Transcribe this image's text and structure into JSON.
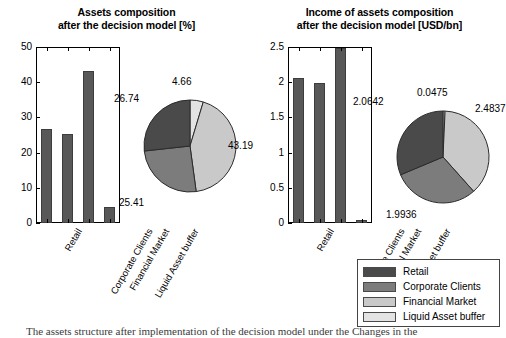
{
  "legend": {
    "items": [
      {
        "label": "Retail",
        "color": "#4a4a4a"
      },
      {
        "label": "Corporate Clients",
        "color": "#7c7c7c"
      },
      {
        "label": "Financial Market",
        "color": "#c9c9c9"
      },
      {
        "label": "Liquid Asset buffer",
        "color": "#e3e3e3"
      }
    ]
  },
  "caption": {
    "text": "The assets structure after implementation of the decision model under the Changes in the"
  },
  "chart_data": [
    {
      "type": "bar",
      "panel": "left",
      "title": "Assets composition",
      "subtitle": "after the decision model [%]",
      "title_line1": "Assets composition",
      "title_line2": "after the decision model [%]",
      "categories": [
        "Retail",
        "Corporate Clients",
        "Financial Market",
        "Liquid Asset buffer"
      ],
      "values": [
        26.74,
        25.41,
        43.19,
        4.66
      ],
      "xlabel": "",
      "ylabel": "",
      "ylim": [
        0,
        50
      ],
      "yticks": [
        0,
        10,
        20,
        30,
        40,
        50
      ],
      "ytick_labels": [
        "0",
        "10",
        "20",
        "30",
        "40",
        "50"
      ],
      "grid": false,
      "bar_color": "#585858"
    },
    {
      "type": "pie",
      "panel": "left",
      "title": "Assets composition",
      "categories": [
        "Liquid Asset buffer",
        "Financial Market",
        "Corporate Clients",
        "Retail"
      ],
      "values": [
        4.66,
        43.19,
        25.41,
        26.74
      ],
      "labels": [
        "4.66",
        "43.19",
        "25.41",
        "26.74"
      ],
      "colors": [
        "#e3e3e3",
        "#c9c9c9",
        "#7c7c7c",
        "#4a4a4a"
      ],
      "legend_position": "bottom-right"
    },
    {
      "type": "bar",
      "panel": "right",
      "title": "Income of assets composition",
      "subtitle": "after the decision model [USD/bn]",
      "title_line1": "Income of assets composition",
      "title_line2": "after the decision model [USD/bn]",
      "categories": [
        "Retail",
        "Corporate Clients",
        "Financial Market",
        "Liquid Asset buffer"
      ],
      "values": [
        2.0642,
        1.9936,
        2.4837,
        0.0475
      ],
      "xlabel": "",
      "ylabel": "",
      "ylim": [
        0,
        2.5
      ],
      "yticks": [
        0,
        0.5,
        1,
        1.5,
        2,
        2.5
      ],
      "ytick_labels": [
        "0",
        "0.5",
        "1",
        "1.5",
        "2",
        "2.5"
      ],
      "grid": false,
      "bar_color": "#585858"
    },
    {
      "type": "pie",
      "panel": "right",
      "title": "Income of assets composition",
      "categories": [
        "Liquid Asset buffer",
        "Financial Market",
        "Corporate Clients",
        "Retail"
      ],
      "values": [
        0.0475,
        2.4837,
        1.9936,
        2.0642
      ],
      "labels": [
        "0.0475",
        "2.4837",
        "1.9936",
        "2.0642"
      ],
      "colors": [
        "#e3e3e3",
        "#c9c9c9",
        "#7c7c7c",
        "#4a4a4a"
      ],
      "legend_position": "bottom-right"
    }
  ]
}
